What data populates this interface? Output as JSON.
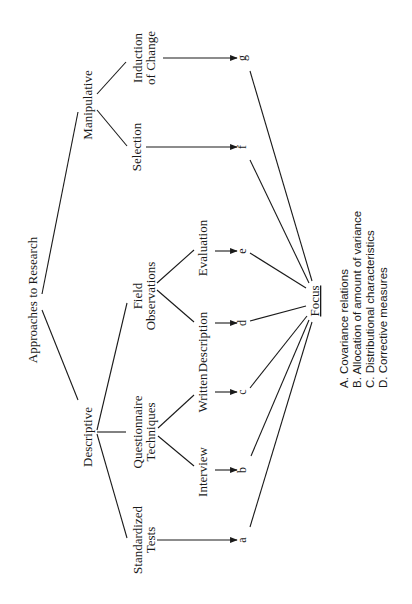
{
  "diagram": {
    "orientation": "rotated-90-ccw",
    "root": {
      "id": "root",
      "label": "Approaches to Research",
      "x": 33,
      "y": 300
    },
    "nodes": [
      {
        "id": "manipulative",
        "label": "Manipulative",
        "x": 88,
        "y": 105,
        "parent": "root"
      },
      {
        "id": "descriptive",
        "label": "Descriptive",
        "x": 88,
        "y": 437,
        "parent": "root"
      },
      {
        "id": "induction",
        "lines": [
          "Induction",
          "of Change"
        ],
        "x": 145,
        "y": 58,
        "parent": "manipulative"
      },
      {
        "id": "selection",
        "lines": [
          "Selection"
        ],
        "x": 137,
        "y": 147,
        "parent": "manipulative"
      },
      {
        "id": "field",
        "lines": [
          "Field",
          "Observations"
        ],
        "x": 145,
        "y": 296,
        "parent": "descriptive"
      },
      {
        "id": "questionnaire",
        "lines": [
          "Questionnaire",
          "Techniques"
        ],
        "x": 145,
        "y": 432,
        "parent": "descriptive"
      },
      {
        "id": "standardized",
        "lines": [
          "Standardized",
          "Tests"
        ],
        "x": 145,
        "y": 540,
        "parent": "descriptive"
      },
      {
        "id": "evaluation",
        "lines": [
          "Evaluation"
        ],
        "x": 203,
        "y": 248,
        "parent": "field"
      },
      {
        "id": "description",
        "lines": [
          "Description"
        ],
        "x": 203,
        "y": 342,
        "parent": "field"
      },
      {
        "id": "written",
        "lines": [
          "Written"
        ],
        "x": 203,
        "y": 393,
        "parent": "questionnaire"
      },
      {
        "id": "interview",
        "lines": [
          "Interview"
        ],
        "x": 203,
        "y": 472,
        "parent": "questionnaire"
      }
    ],
    "outcomes": [
      {
        "id": "g",
        "label": "g",
        "x": 243,
        "y": 58,
        "from": "induction"
      },
      {
        "id": "f",
        "label": "f",
        "x": 243,
        "y": 147,
        "from": "selection"
      },
      {
        "id": "e",
        "label": "e",
        "x": 243,
        "y": 251,
        "from": "evaluation"
      },
      {
        "id": "d",
        "label": "d",
        "x": 243,
        "y": 323,
        "from": "description"
      },
      {
        "id": "c",
        "label": "c",
        "x": 243,
        "y": 392,
        "from": "written"
      },
      {
        "id": "b",
        "label": "b",
        "x": 243,
        "y": 470,
        "from": "interview"
      },
      {
        "id": "a",
        "label": "a",
        "x": 243,
        "y": 540,
        "from": "standardized"
      }
    ],
    "focus": {
      "label": "Focus",
      "x": 315,
      "y": 300,
      "underlined": true
    },
    "legend": [
      "A. Covariance relations",
      "B. Allocation of amount of variance",
      "C. Distributional characteristics",
      "D. Corrective measures"
    ]
  }
}
